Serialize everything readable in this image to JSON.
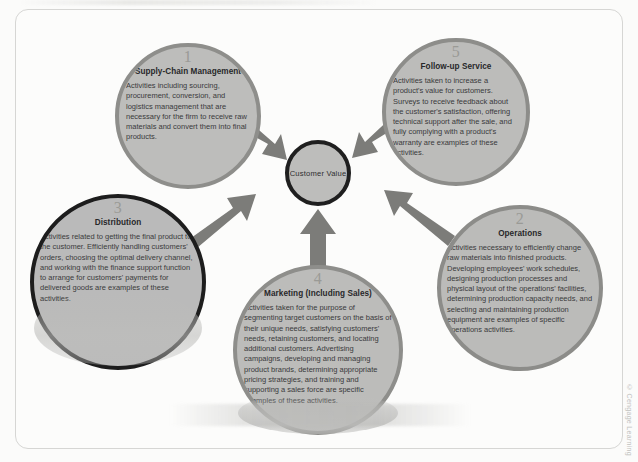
{
  "figure": {
    "center": {
      "label": "Customer Value"
    },
    "credit": "© Cengage Learning",
    "nodes": [
      {
        "number": "1",
        "title": "Supply-Chain Management",
        "body": "Activities including sourcing, procurement, conversion, and logistics management that are necessary for the firm to receive raw materials and convert them into final products."
      },
      {
        "number": "2",
        "title": "Operations",
        "body": "Activities necessary to efficiently change raw materials into finished products. Developing employees' work schedules, designing production processes and physical layout of the operations' facilities, determining production capacity needs, and selecting and maintaining production equipment are examples of specific operations activities."
      },
      {
        "number": "3",
        "title": "Distribution",
        "body": "Activities related to getting the final product to the customer. Efficiently handling customers' orders, choosing the optimal delivery channel, and working with the finance support function to arrange for customers' payments for delivered goods are examples of these activities."
      },
      {
        "number": "4",
        "title": "Marketing (Including Sales)",
        "body": "Activities taken for the purpose of segmenting target customers on the basis of their unique needs, satisfying customers' needs, retaining customers, and locating additional customers. Advertising campaigns, developing and managing product brands, determining appropriate pricing strategies, and training and supporting a sales force are specific examples of these activities."
      },
      {
        "number": "5",
        "title": "Follow-up Service",
        "body": "Activities taken to increase a product's value for customers. Surveys to receive feedback about the customer's satisfaction, offering technical support after the sale, and fully complying with a product's warranty are examples of these activities."
      }
    ],
    "colors": {
      "circle_fill": "#bdbdbb",
      "circle_border": "#8e8e8b",
      "circle_border_dark": "#1d1d1d",
      "arrow": "#7b7b78",
      "page_background": "#fbfbfa",
      "frame_border": "#d6d6d4"
    },
    "arrows": [
      {
        "from": "1",
        "to": "center",
        "direction": "down-right"
      },
      {
        "from": "5",
        "to": "center",
        "direction": "down-left"
      },
      {
        "from": "2",
        "to": "center",
        "direction": "up-left"
      },
      {
        "from": "3",
        "to": "center",
        "direction": "up-right"
      },
      {
        "from": "4",
        "to": "center",
        "direction": "up"
      }
    ]
  }
}
